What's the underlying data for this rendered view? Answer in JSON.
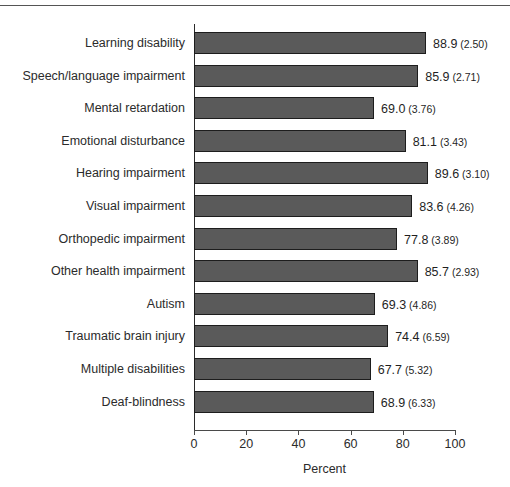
{
  "chart_data": {
    "type": "bar",
    "orientation": "horizontal",
    "title": "",
    "xlabel": "Percent",
    "ylabel": "",
    "xlim": [
      0,
      100
    ],
    "xticks": [
      0,
      20,
      40,
      60,
      80,
      100
    ],
    "xtick_labels": [
      "0",
      "20",
      "40",
      "60",
      "80",
      "100"
    ],
    "grid": false,
    "legend": null,
    "bar_color": "#5a5a5a",
    "bar_edge_color": "#1d1d1d",
    "categories": [
      "Learning disability",
      "Speech/language impairment",
      "Mental retardation",
      "Emotional disturbance",
      "Hearing impairment",
      "Visual impairment",
      "Orthopedic impairment",
      "Other health impairment",
      "Autism",
      "Traumatic brain injury",
      "Multiple disabilities",
      "Deaf-blindness"
    ],
    "values": [
      88.9,
      85.9,
      69.0,
      81.1,
      89.6,
      83.6,
      77.8,
      85.7,
      69.3,
      74.4,
      67.7,
      68.9
    ],
    "standard_errors": [
      2.5,
      2.71,
      3.76,
      3.43,
      3.1,
      4.26,
      3.89,
      2.93,
      4.86,
      6.59,
      5.32,
      6.33
    ],
    "annotations": [
      {
        "category": "Learning disability",
        "value_text": "88.9",
        "se_text": "(2.50)"
      },
      {
        "category": "Speech/language impairment",
        "value_text": "85.9",
        "se_text": "(2.71)"
      },
      {
        "category": "Mental retardation",
        "value_text": "69.0",
        "se_text": "(3.76)"
      },
      {
        "category": "Emotional disturbance",
        "value_text": "81.1",
        "se_text": "(3.43)"
      },
      {
        "category": "Hearing impairment",
        "value_text": "89.6",
        "se_text": "(3.10)"
      },
      {
        "category": "Visual impairment",
        "value_text": "83.6",
        "se_text": "(4.26)"
      },
      {
        "category": "Orthopedic impairment",
        "value_text": "77.8",
        "se_text": "(3.89)"
      },
      {
        "category": "Other health impairment",
        "value_text": "85.7",
        "se_text": "(2.93)"
      },
      {
        "category": "Autism",
        "value_text": "69.3",
        "se_text": "(4.86)"
      },
      {
        "category": "Traumatic brain injury",
        "value_text": "74.4",
        "se_text": "(6.59)"
      },
      {
        "category": "Multiple disabilities",
        "value_text": "67.7",
        "se_text": "(5.32)"
      },
      {
        "category": "Deaf-blindness",
        "value_text": "68.9",
        "se_text": "(6.33)"
      }
    ]
  }
}
